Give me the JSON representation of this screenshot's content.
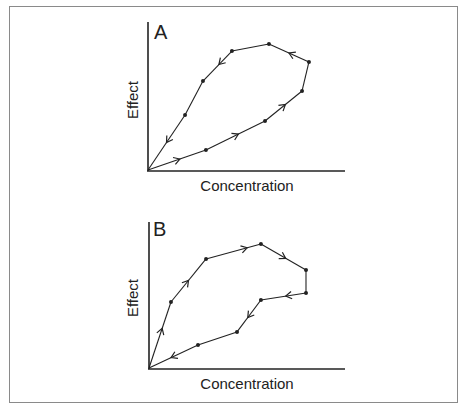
{
  "figure": {
    "panels": [
      {
        "label": "A",
        "xlabel": "Concentration",
        "ylabel": "Effect"
      },
      {
        "label": "B",
        "xlabel": "Concentration",
        "ylabel": "Effect"
      }
    ]
  },
  "chart_data": [
    {
      "type": "line",
      "title": "A",
      "xlabel": "Concentration",
      "ylabel": "Effect",
      "xlim": [
        0,
        100
      ],
      "ylim": [
        0,
        100
      ],
      "grid": false,
      "loop_direction": "counterclockwise",
      "series": [
        {
          "name": "A",
          "x": [
            0,
            29.4,
            59.4,
            78.2,
            81.7,
            61.4,
            42.6,
            27.9,
            18.8,
            0
          ],
          "y": [
            0,
            13.5,
            33.1,
            53.4,
            73.0,
            85.1,
            80.4,
            60.1,
            37.2,
            0
          ]
        }
      ],
      "arrows": [
        {
          "segment": 0,
          "t": 0.55
        },
        {
          "segment": 1,
          "t": 0.55
        },
        {
          "segment": 2,
          "t": 0.55
        },
        {
          "segment": 4,
          "t": 0.5
        },
        {
          "segment": 6,
          "t": 0.45
        },
        {
          "segment": 8,
          "t": 0.5
        }
      ]
    },
    {
      "type": "line",
      "title": "B",
      "xlabel": "Concentration",
      "ylabel": "Effect",
      "xlim": [
        0,
        100
      ],
      "ylim": [
        0,
        100
      ],
      "grid": false,
      "loop_direction": "clockwise",
      "series": [
        {
          "name": "B",
          "x": [
            0,
            11.2,
            29.1,
            57.1,
            80.1,
            80.1,
            57.1,
            44.9,
            25.0,
            0
          ],
          "y": [
            0,
            45.2,
            74.7,
            84.9,
            67.1,
            51.4,
            46.6,
            24.7,
            15.8,
            0
          ]
        }
      ],
      "arrows": [
        {
          "segment": 0,
          "t": 0.6
        },
        {
          "segment": 1,
          "t": 0.5
        },
        {
          "segment": 2,
          "t": 0.75
        },
        {
          "segment": 3,
          "t": 0.55
        },
        {
          "segment": 5,
          "t": 0.45
        },
        {
          "segment": 6,
          "t": 0.55
        },
        {
          "segment": 8,
          "t": 0.55
        }
      ]
    }
  ]
}
